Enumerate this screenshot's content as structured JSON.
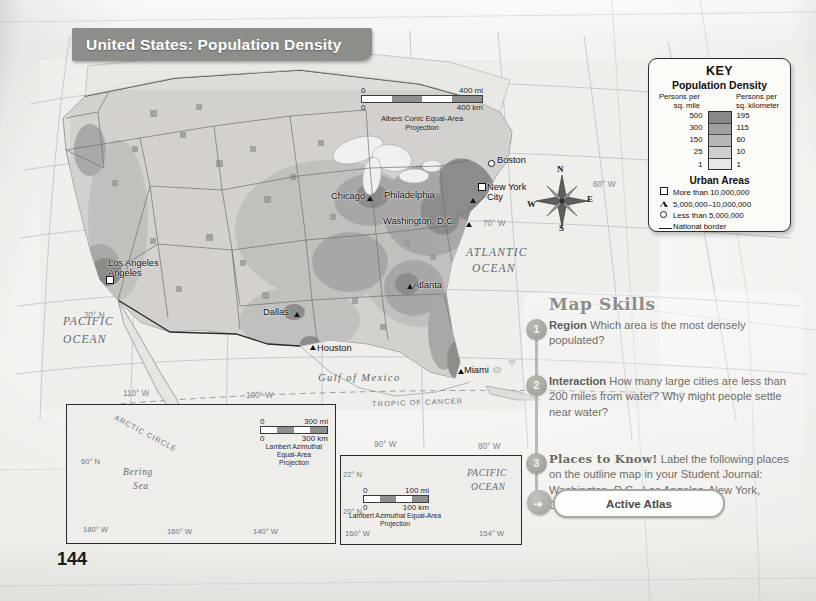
{
  "page": {
    "number": "144",
    "title": "United States: Population Density"
  },
  "map": {
    "scale": {
      "zero_top": "0",
      "miles": "400 mi",
      "zero_bottom": "0",
      "km": "400 km",
      "projection_line1": "Albers Conic Equal-Area",
      "projection_line2": "Projection"
    },
    "compass": {
      "n": "N",
      "e": "E",
      "s": "S",
      "w": "W"
    },
    "cities": [
      {
        "name": "Boston",
        "symbol": "circle",
        "x": 488,
        "y": 160,
        "lx": 497,
        "ly": 155
      },
      {
        "name": "New York",
        "symbol": "square",
        "x": 478,
        "y": 183,
        "lx": 487,
        "ly": 182,
        "name2": "City"
      },
      {
        "name": "Philadelphia",
        "symbol": "triangle",
        "x": 470,
        "y": 198,
        "lx": 384,
        "ly": 190
      },
      {
        "name": "Washington, D.C.",
        "symbol": "triangle",
        "x": 466,
        "y": 222,
        "lx": 383,
        "ly": 216
      },
      {
        "name": "Chicago",
        "symbol": "triangle",
        "x": 367,
        "y": 196,
        "lx": 331,
        "ly": 191
      },
      {
        "name": "Atlanta",
        "symbol": "triangle",
        "x": 407,
        "y": 284,
        "lx": 413,
        "ly": 280
      },
      {
        "name": "Dallas",
        "symbol": "triangle",
        "x": 294,
        "y": 312,
        "lx": 263,
        "ly": 307
      },
      {
        "name": "Houston",
        "symbol": "triangle",
        "x": 310,
        "y": 345,
        "lx": 317,
        "ly": 343
      },
      {
        "name": "Miami",
        "symbol": "triangle",
        "x": 458,
        "y": 369,
        "lx": 464,
        "ly": 365
      },
      {
        "name": "Los Angeles",
        "symbol": "square",
        "x": 106,
        "y": 276,
        "lx": 108,
        "ly": 258,
        "name2": "Angeles"
      }
    ],
    "water_labels": [
      {
        "text": "ATLANTIC",
        "x": 466,
        "y": 246
      },
      {
        "text": "OCEAN",
        "x": 472,
        "y": 262
      },
      {
        "text": "PACIFIC",
        "x": 63,
        "y": 315
      },
      {
        "text": "OCEAN",
        "x": 63,
        "y": 333
      },
      {
        "text": "Gulf of Mexico",
        "x": 318,
        "y": 372
      }
    ],
    "graticule": [
      {
        "text": "60° W",
        "x": 593,
        "y": 180
      },
      {
        "text": "70° W",
        "x": 483,
        "y": 219
      },
      {
        "text": "30° N",
        "x": 84,
        "y": 311
      },
      {
        "text": "110° W",
        "x": 123,
        "y": 389
      },
      {
        "text": "100° W",
        "x": 246,
        "y": 391
      },
      {
        "text": "90° W",
        "x": 374,
        "y": 440
      },
      {
        "text": "80° W",
        "x": 478,
        "y": 442
      }
    ],
    "tropic_label": "TROPIC OF CANCER"
  },
  "key": {
    "title": "KEY",
    "subtitle": "Population Density",
    "col_left_l1": "Persons per",
    "col_left_l2": "sq. mile",
    "col_right_l1": "Persons per",
    "col_right_l2": "sq. kilometer",
    "ramp": [
      {
        "mile": "500",
        "km": "195",
        "color": "#878787"
      },
      {
        "mile": "300",
        "km": "115",
        "color": "#a0a0a0"
      },
      {
        "mile": "150",
        "km": "60",
        "color": "#b6b6b6"
      },
      {
        "mile": "25",
        "km": "10",
        "color": "#cfcfcf"
      },
      {
        "mile": "1",
        "km": "1",
        "color": "#e8e8e6"
      }
    ],
    "urban_title": "Urban Areas",
    "urban_items": [
      {
        "symbol": "square",
        "label": "More than 10,000,000"
      },
      {
        "symbol": "triangle",
        "label": "5,000,000–10,000,000"
      },
      {
        "symbol": "circle",
        "label": "Less than 5,000,000"
      },
      {
        "symbol": "line",
        "label": "National border"
      }
    ]
  },
  "insets": {
    "alaska": {
      "sea_label": "Bering",
      "sea_label2": "Sea",
      "arctic": "ARCTIC CIRCLE",
      "graticule": [
        {
          "text": "180° W",
          "x": 16,
          "y": 120
        },
        {
          "text": "160° W",
          "x": 100,
          "y": 122
        },
        {
          "text": "140° W",
          "x": 186,
          "y": 122
        },
        {
          "text": "60° N",
          "x": 14,
          "y": 52
        }
      ],
      "scale": {
        "zero_top": "0",
        "miles": "300 mi",
        "zero_bottom": "0",
        "km": "300 km",
        "projection_line1": "Lambert Azimuthal",
        "projection_line2": "Equal-Area",
        "projection_line3": "Projection"
      }
    },
    "hawaii": {
      "ocean_l1": "PACIFIC",
      "ocean_l2": "OCEAN",
      "graticule": [
        {
          "text": "22° N",
          "x": 2,
          "y": 14
        },
        {
          "text": "20° N",
          "x": 2,
          "y": 51
        },
        {
          "text": "160° W",
          "x": 4,
          "y": 73
        },
        {
          "text": "154° W",
          "x": 138,
          "y": 73
        }
      ],
      "scale": {
        "zero_top": "0",
        "miles": "100 mi",
        "zero_bottom": "0",
        "km": "100 km",
        "projection_line1": "Lambert Azimuthal Equal-Area",
        "projection_line2": "Projection"
      }
    }
  },
  "skills": {
    "heading": "Map Skills",
    "items": [
      {
        "num": "1",
        "bold": "Region",
        "text": " Which area is the most densely populated?"
      },
      {
        "num": "2",
        "bold": "Interaction",
        "text": " How many large cities are less than 200 miles from water? Why might people settle near water?"
      },
      {
        "num": "3",
        "bold": "Places to Know!",
        "text": " Label the following places on the outline map in your Student Journal: Washington, D.C., Los Angeles, New York, Chicago."
      }
    ],
    "atlas_button": "Active Atlas"
  },
  "colors": {
    "banner": "#8d8d8a",
    "ink": "#1a1a1a",
    "skills_text": "#6e6e6a",
    "water": "#5d6a72"
  }
}
